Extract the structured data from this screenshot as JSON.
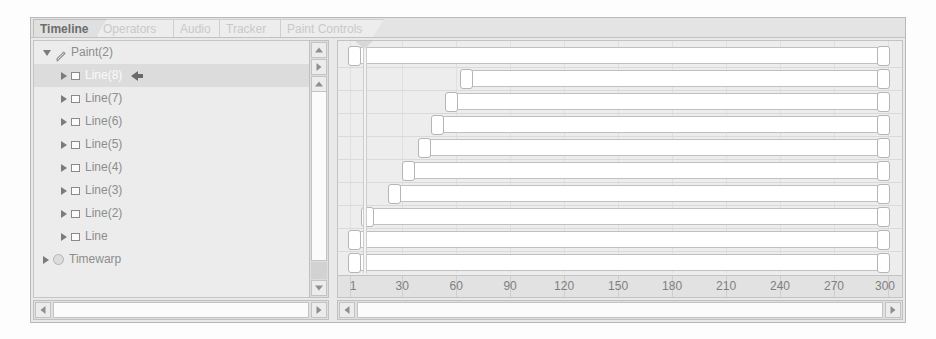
{
  "window": {
    "title": "Timeline"
  },
  "tabs": [
    {
      "label": "Timeline",
      "active": true
    },
    {
      "label": "Operators",
      "active": false
    },
    {
      "label": "Audio",
      "active": false
    },
    {
      "label": "Tracker",
      "active": false
    },
    {
      "label": "Paint Controls",
      "active": false
    }
  ],
  "tree": {
    "items": [
      {
        "label": "Paint(2)",
        "depth": 0,
        "icon": "brush-icon",
        "disclosure": "expanded",
        "selected": false,
        "marker": false
      },
      {
        "label": "Line(8)",
        "depth": 1,
        "icon": "layer-icon",
        "disclosure": "collapsed",
        "selected": true,
        "marker": true
      },
      {
        "label": "Line(7)",
        "depth": 1,
        "icon": "layer-icon",
        "disclosure": "collapsed",
        "selected": false,
        "marker": false
      },
      {
        "label": "Line(6)",
        "depth": 1,
        "icon": "layer-icon",
        "disclosure": "collapsed",
        "selected": false,
        "marker": false
      },
      {
        "label": "Line(5)",
        "depth": 1,
        "icon": "layer-icon",
        "disclosure": "collapsed",
        "selected": false,
        "marker": false
      },
      {
        "label": "Line(4)",
        "depth": 1,
        "icon": "layer-icon",
        "disclosure": "collapsed",
        "selected": false,
        "marker": false
      },
      {
        "label": "Line(3)",
        "depth": 1,
        "icon": "layer-icon",
        "disclosure": "collapsed",
        "selected": false,
        "marker": false
      },
      {
        "label": "Line(2)",
        "depth": 1,
        "icon": "layer-icon",
        "disclosure": "collapsed",
        "selected": false,
        "marker": false
      },
      {
        "label": "Line",
        "depth": 1,
        "icon": "layer-icon",
        "disclosure": "collapsed",
        "selected": false,
        "marker": false
      },
      {
        "label": "Timewarp",
        "depth": 0,
        "icon": "circle-icon",
        "disclosure": "collapsed",
        "selected": false,
        "marker": false
      }
    ]
  },
  "timeline": {
    "ruler": {
      "start_frame": 1,
      "end_frame": 300,
      "tick_labels": [
        "1",
        "30",
        "60",
        "90",
        "120",
        "150",
        "180",
        "210",
        "240",
        "270",
        "300"
      ],
      "tick_frames": [
        1,
        30,
        60,
        90,
        120,
        150,
        180,
        210,
        240,
        270,
        300
      ]
    },
    "playhead_frame": 8,
    "bars": [
      {
        "track": "Paint(2)",
        "start_frame": 1,
        "end_frame": 300
      },
      {
        "track": "Line(8)",
        "start_frame": 63,
        "end_frame": 300
      },
      {
        "track": "Line(7)",
        "start_frame": 55,
        "end_frame": 300
      },
      {
        "track": "Line(6)",
        "start_frame": 47,
        "end_frame": 300
      },
      {
        "track": "Line(5)",
        "start_frame": 40,
        "end_frame": 300
      },
      {
        "track": "Line(4)",
        "start_frame": 31,
        "end_frame": 300
      },
      {
        "track": "Line(3)",
        "start_frame": 23,
        "end_frame": 300
      },
      {
        "track": "Line(2)",
        "start_frame": 8,
        "end_frame": 300
      },
      {
        "track": "Line",
        "start_frame": 1,
        "end_frame": 300
      },
      {
        "track": "Timewarp",
        "start_frame": 1,
        "end_frame": 300
      }
    ]
  },
  "scrollbars": {
    "vertical": {
      "up_button": "scroll-up-icon",
      "play_button": "play-icon",
      "top_button": "scroll-top-icon",
      "down_button": "scroll-down-icon"
    },
    "horizontal_left": {
      "left_button": "scroll-left-icon",
      "right_button": "scroll-right-icon"
    },
    "horizontal_right": {
      "left_button": "scroll-left-icon",
      "right_button": "scroll-right-icon"
    }
  },
  "colors": {
    "panel_bg": "#ececec",
    "bar_fill": "#ffffff",
    "selection": "#dcdcdc",
    "text": "#8c8c8c"
  }
}
